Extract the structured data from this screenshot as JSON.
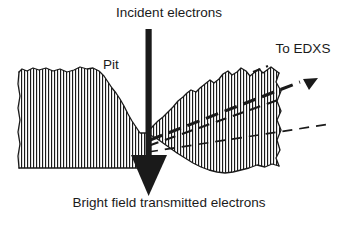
{
  "figure": {
    "background_color": "#ffffff",
    "ink_color": "#1a1a1a",
    "width": 338,
    "height": 225
  },
  "labels": {
    "incident_beam": "Incident electrons",
    "edxs": "To EDXS",
    "pit": "Pit",
    "bright_field": "Bright field transmitted electrons"
  },
  "annotations": {
    "incident_beam_icon": "down-arrow-icon",
    "edxs_ray_icon": "dashed-ray-arrow-icon",
    "transmitted_beam_icon": "solid-down-arrowhead-icon",
    "specimen_icon": "hatched-cross-section-icon"
  },
  "diagram_elements": [
    {
      "name": "specimen-cross-section",
      "description": "Vertically hatched foil cross-section with irregular upper surface",
      "hatch_spacing_px": 3,
      "hatch_color": "#1a1a1a"
    },
    {
      "name": "pit",
      "description": "V-shaped depression in the specimen upper surface where the beam enters"
    },
    {
      "name": "incident-beam-arrow",
      "description": "Thick vertical black beam entering from the top and terminating in a large solid arrowhead below the specimen"
    },
    {
      "name": "edxs-ray-upper",
      "description": "Dashed ray leaving the interaction volume toward the upper right, ending in a small solid arrowhead"
    },
    {
      "name": "edxs-ray-middle",
      "description": "Dashed ray leaving the interaction volume toward the right"
    },
    {
      "name": "edxs-ray-lower",
      "description": "Dashed ray leaving the interaction volume toward the lower right"
    }
  ]
}
